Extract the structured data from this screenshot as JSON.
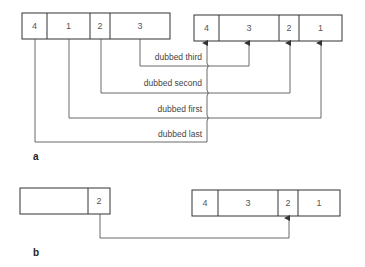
{
  "panel_a": {
    "label": "a",
    "source_tape": {
      "cells": [
        {
          "label": "4",
          "x": 22,
          "w": 25
        },
        {
          "label": "1",
          "x": 47,
          "w": 43
        },
        {
          "label": "2",
          "x": 90,
          "w": 20
        },
        {
          "label": "3",
          "x": 110,
          "w": 60
        }
      ]
    },
    "dest_tape": {
      "cells": [
        {
          "label": "4",
          "x": 194,
          "w": 25
        },
        {
          "label": "3",
          "x": 219,
          "w": 60
        },
        {
          "label": "2",
          "x": 279,
          "w": 20
        },
        {
          "label": "1",
          "x": 299,
          "w": 43
        }
      ]
    },
    "connections": [
      {
        "label": "dubbed third",
        "from": "3"
      },
      {
        "label": "dubbed second",
        "from": "2"
      },
      {
        "label": "dubbed first",
        "from": "1"
      },
      {
        "label": "dubbed last",
        "from": "4"
      }
    ]
  },
  "panel_b": {
    "label": "b",
    "source_tape": {
      "cells": [
        {
          "label": "",
          "x": 20,
          "w": 68
        },
        {
          "label": "2",
          "x": 88,
          "w": 22
        }
      ]
    },
    "dest_tape": {
      "cells": [
        {
          "label": "4",
          "x": 192,
          "w": 26
        },
        {
          "label": "3",
          "x": 218,
          "w": 60
        },
        {
          "label": "2",
          "x": 278,
          "w": 20
        },
        {
          "label": "1",
          "x": 298,
          "w": 42
        }
      ]
    }
  }
}
